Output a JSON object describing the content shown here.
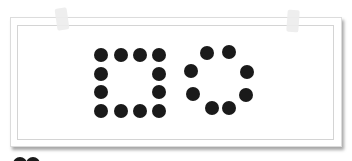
{
  "figure": {
    "shapes": [
      {
        "name": "square-of-dots",
        "dot_count": 12,
        "dots": [
          [
            101,
            55
          ],
          [
            121,
            55
          ],
          [
            140,
            55
          ],
          [
            159,
            55
          ],
          [
            101,
            74
          ],
          [
            159,
            74
          ],
          [
            101,
            92
          ],
          [
            159,
            92
          ],
          [
            101,
            111
          ],
          [
            121,
            111
          ],
          [
            140,
            111
          ],
          [
            159,
            111
          ]
        ]
      },
      {
        "name": "circle-of-dots",
        "dot_count": 8,
        "dots": [
          [
            207,
            53
          ],
          [
            229,
            52
          ],
          [
            191,
            71
          ],
          [
            247,
            72
          ],
          [
            193,
            94
          ],
          [
            246,
            95
          ],
          [
            212,
            108
          ],
          [
            229,
            108
          ]
        ]
      }
    ],
    "partial_dots_bottom": [
      [
        20,
        160
      ],
      [
        33,
        160
      ]
    ],
    "colors": {
      "dot": "#1a1a1a",
      "paper": "#ffffff",
      "border": "#d4d4d4",
      "tape": "#ececec"
    }
  }
}
